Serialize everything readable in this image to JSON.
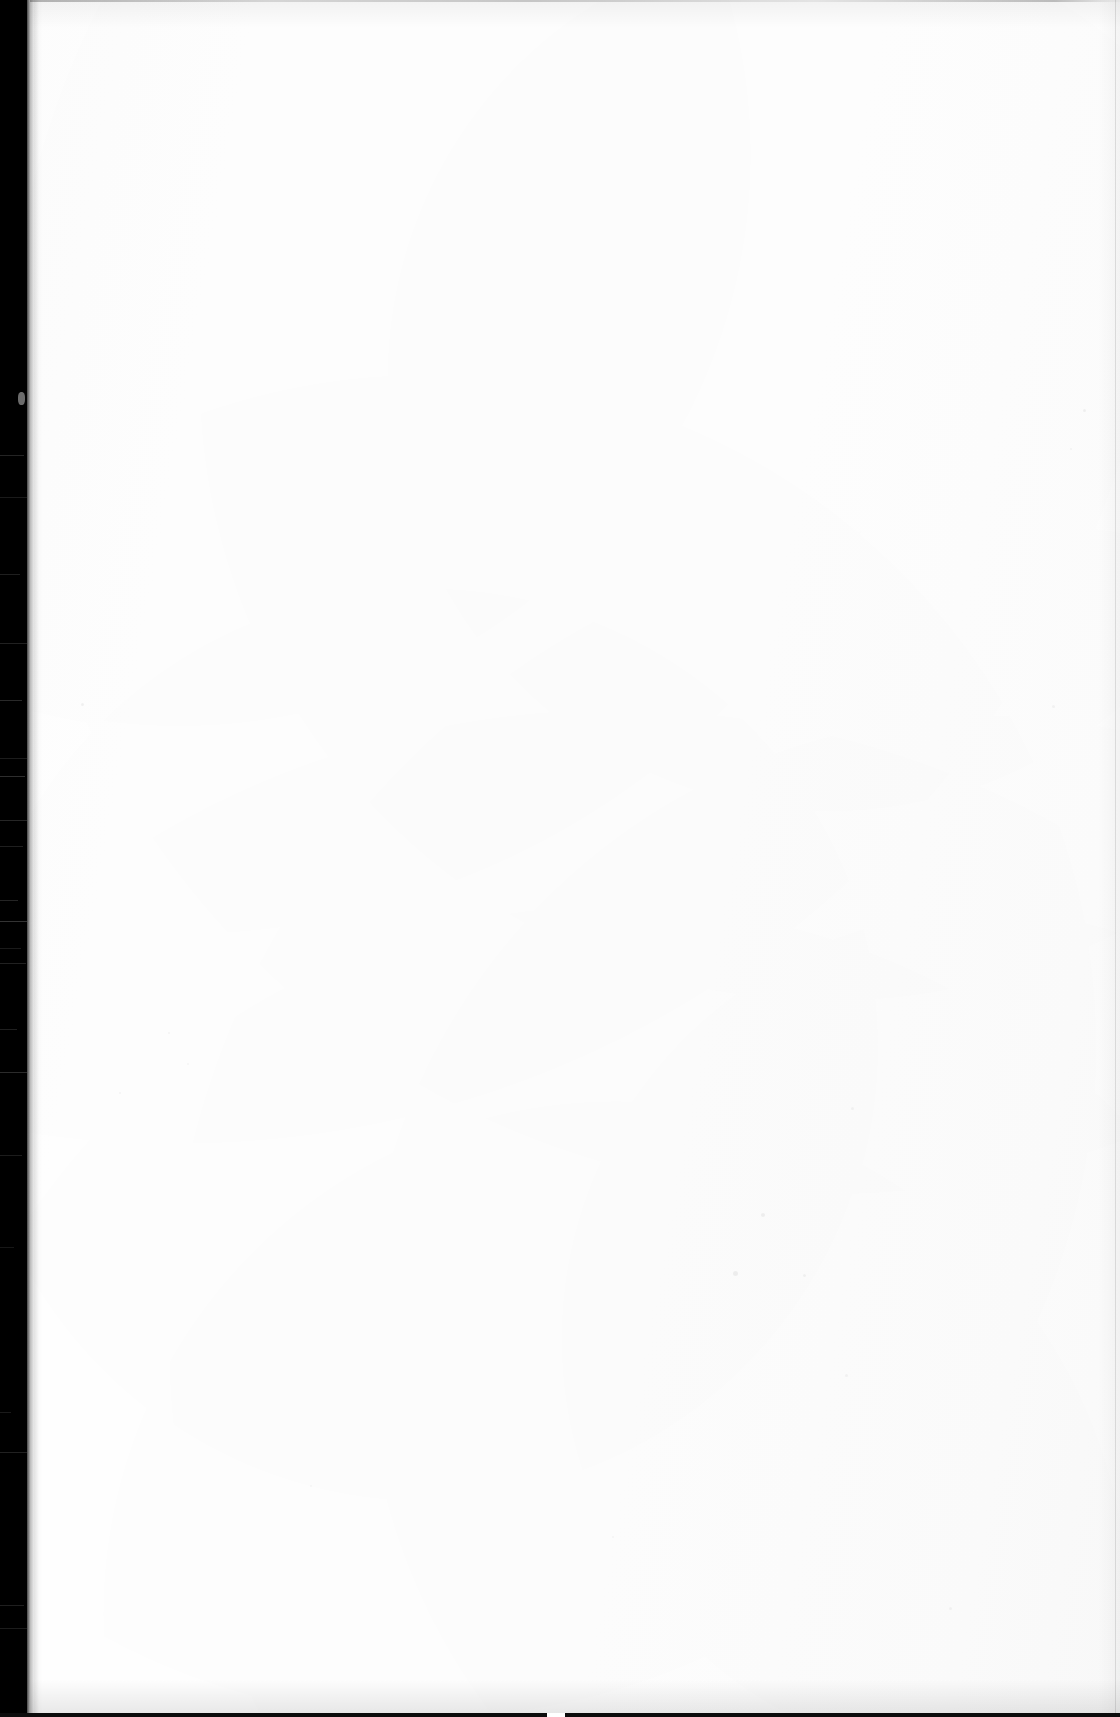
{
  "document": {
    "kind": "scanned-page",
    "state_label": "blank",
    "page_width": 1120,
    "page_height": 1717,
    "paper_color": "#ffffff",
    "gutter_color": "#000000",
    "edge_line_color": "#0c0c0c",
    "visible_text": "",
    "body_text": "",
    "header_text": "",
    "footer_text": "",
    "page_number": ""
  },
  "artifacts": {
    "left_gutter": {
      "name": "scanner-gutter-band",
      "x": 0,
      "width": 27,
      "color": "#000000"
    },
    "gutter_ticks": [
      {
        "y": 455,
        "width": 24,
        "opacity": 0.14
      },
      {
        "y": 497,
        "width": 27,
        "opacity": 0.1
      },
      {
        "y": 574,
        "width": 20,
        "opacity": 0.12
      },
      {
        "y": 643,
        "width": 27,
        "opacity": 0.13
      },
      {
        "y": 700,
        "width": 22,
        "opacity": 0.16
      },
      {
        "y": 758,
        "width": 27,
        "opacity": 0.11
      },
      {
        "y": 776,
        "width": 25,
        "opacity": 0.18
      },
      {
        "y": 820,
        "width": 27,
        "opacity": 0.15
      },
      {
        "y": 846,
        "width": 23,
        "opacity": 0.12
      },
      {
        "y": 900,
        "width": 18,
        "opacity": 0.14
      },
      {
        "y": 921,
        "width": 27,
        "opacity": 0.2
      },
      {
        "y": 948,
        "width": 21,
        "opacity": 0.1
      },
      {
        "y": 963,
        "width": 26,
        "opacity": 0.13
      },
      {
        "y": 1029,
        "width": 17,
        "opacity": 0.12
      },
      {
        "y": 1072,
        "width": 27,
        "opacity": 0.17
      },
      {
        "y": 1155,
        "width": 22,
        "opacity": 0.11
      },
      {
        "y": 1247,
        "width": 14,
        "opacity": 0.09
      },
      {
        "y": 1412,
        "width": 11,
        "opacity": 0.1
      },
      {
        "y": 1452,
        "width": 27,
        "opacity": 0.13
      },
      {
        "y": 1605,
        "width": 24,
        "opacity": 0.12
      },
      {
        "y": 1628,
        "width": 27,
        "opacity": 0.11
      }
    ],
    "gutter_nick": {
      "x": 18,
      "y": 392,
      "width": 7,
      "height": 13
    },
    "top_edge_rule": {
      "y": 0,
      "height": 2
    },
    "right_edge_rule": {
      "x": 1115,
      "width": 1
    },
    "bottom_edge_rule": {
      "y": 1713,
      "height": 4,
      "break_x": 547,
      "break_width": 18
    },
    "dust_specks": [
      {
        "x": 81,
        "y": 703,
        "size": 3,
        "opacity": 0.05
      },
      {
        "x": 168,
        "y": 1032,
        "size": 2,
        "opacity": 0.04
      },
      {
        "x": 187,
        "y": 1063,
        "size": 2,
        "opacity": 0.035
      },
      {
        "x": 119,
        "y": 1092,
        "size": 2,
        "opacity": 0.04
      },
      {
        "x": 761,
        "y": 1213,
        "size": 4,
        "opacity": 0.05
      },
      {
        "x": 733,
        "y": 1271,
        "size": 5,
        "opacity": 0.055
      },
      {
        "x": 851,
        "y": 1107,
        "size": 3,
        "opacity": 0.04
      },
      {
        "x": 803,
        "y": 1274,
        "size": 3,
        "opacity": 0.045
      },
      {
        "x": 845,
        "y": 1374,
        "size": 3,
        "opacity": 0.04
      },
      {
        "x": 1052,
        "y": 705,
        "size": 3,
        "opacity": 0.04
      },
      {
        "x": 1083,
        "y": 409,
        "size": 3,
        "opacity": 0.05
      },
      {
        "x": 1070,
        "y": 448,
        "size": 2,
        "opacity": 0.04
      },
      {
        "x": 310,
        "y": 1485,
        "size": 2,
        "opacity": 0.035
      },
      {
        "x": 612,
        "y": 1536,
        "size": 2,
        "opacity": 0.035
      },
      {
        "x": 949,
        "y": 1607,
        "size": 3,
        "opacity": 0.04
      }
    ]
  }
}
